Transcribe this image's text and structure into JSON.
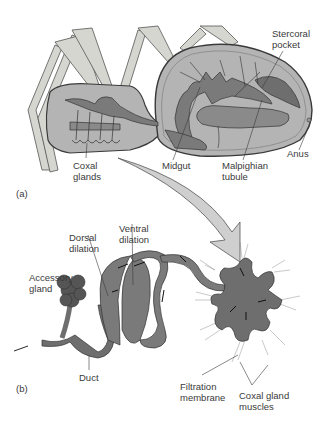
{
  "figure": {
    "panel_a": {
      "marker": "(a)",
      "labels": {
        "stercoral_pocket": "Stercoral\npocket",
        "anus": "Anus",
        "coxal_glands": "Coxal\nglands",
        "midgut": "Midgut",
        "malpighian_tubule": "Malpighian\ntubule"
      }
    },
    "panel_b": {
      "marker": "(b)",
      "labels": {
        "dorsal_dilation": "Dorsal\ndilation",
        "ventral_dilation": "Ventral\ndilation",
        "accessory_gland": "Accessory\ngland",
        "duct": "Duct",
        "filtration_membrane": "Filtration\nmembrane",
        "coxal_gland_muscles": "Coxal gland\nmuscles"
      }
    },
    "colors": {
      "body_fill": "#b4b4b4",
      "organ_dark": "#6e6e6e",
      "organ_mid": "#8a8a8a",
      "leg_fill": "#d6d6d0",
      "arrow_fill": "#cfcfcf",
      "outline": "#3a3a3a"
    }
  }
}
